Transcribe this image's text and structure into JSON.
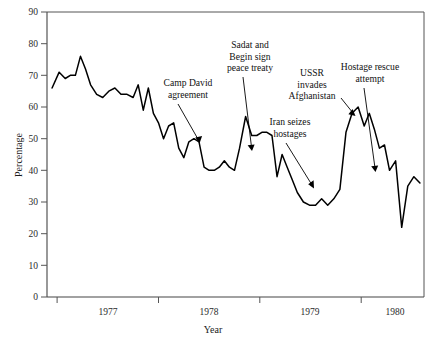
{
  "chart_data": {
    "type": "line",
    "title": "",
    "xlabel": "Year",
    "ylabel": "Percentage",
    "ylim": [
      0,
      90
    ],
    "ytick_values": [
      0,
      10,
      20,
      30,
      40,
      50,
      60,
      70,
      80,
      90
    ],
    "ytick_labels": [
      "0",
      "10",
      "20",
      "30",
      "40",
      "50",
      "60",
      "70",
      "80",
      "90"
    ],
    "xlim": [
      1976.9,
      1980.62
    ],
    "xtick_boundaries": [
      1977.0,
      1978.0,
      1979.0,
      1980.0
    ],
    "xtick_labels": [
      "1977",
      "1978",
      "1979",
      "1980"
    ],
    "xtick_label_positions": [
      1977.5,
      1978.5,
      1979.5,
      1980.3
    ],
    "grid": false,
    "legend": false,
    "series": [
      {
        "name": "Percentage",
        "x": [
          1976.95,
          1977.02,
          1977.08,
          1977.13,
          1977.18,
          1977.23,
          1977.28,
          1977.33,
          1977.39,
          1977.45,
          1977.51,
          1977.57,
          1977.63,
          1977.69,
          1977.75,
          1977.8,
          1977.85,
          1977.9,
          1977.95,
          1978.0,
          1978.05,
          1978.1,
          1978.15,
          1978.2,
          1978.25,
          1978.3,
          1978.35,
          1978.4,
          1978.45,
          1978.5,
          1978.55,
          1978.6,
          1978.65,
          1978.7,
          1978.75,
          1978.8,
          1978.86,
          1978.92,
          1978.97,
          1979.02,
          1979.07,
          1979.12,
          1979.17,
          1979.22,
          1979.27,
          1979.32,
          1979.37,
          1979.43,
          1979.49,
          1979.55,
          1979.61,
          1979.67,
          1979.73,
          1979.79,
          1979.85,
          1979.91,
          1979.97,
          1980.03,
          1980.08,
          1980.13,
          1980.18,
          1980.23,
          1980.28,
          1980.34,
          1980.4,
          1980.46,
          1980.52,
          1980.58
        ],
        "y": [
          66,
          71,
          69,
          70,
          70,
          76,
          72,
          67,
          64,
          63,
          65,
          66,
          64,
          64,
          63,
          67,
          59,
          66,
          58,
          55,
          50,
          54,
          55,
          47,
          44,
          49,
          50,
          49,
          41,
          40,
          40,
          41,
          43,
          41,
          40,
          47,
          57,
          51,
          51,
          52,
          52,
          51,
          38,
          45,
          41,
          37,
          33,
          30,
          29,
          29,
          31,
          29,
          31,
          34,
          52,
          58,
          60,
          54,
          58,
          53,
          47,
          48,
          40,
          43,
          22,
          35,
          38,
          36
        ]
      }
    ],
    "annotations": [
      {
        "id": "camp-david",
        "lines": [
          "Camp David",
          "agreement"
        ],
        "text": "Camp David agreement"
      },
      {
        "id": "sadat-begin",
        "lines": [
          "Sadat and",
          "Begin sign",
          "peace treaty"
        ],
        "text": "Sadat and Begin sign peace treaty"
      },
      {
        "id": "iran-hostages",
        "lines": [
          "Iran seizes",
          "hostages"
        ],
        "text": "Iran seizes hostages"
      },
      {
        "id": "ussr-afghanistan",
        "lines": [
          "USSR",
          "invades",
          "Afghanistan"
        ],
        "text": "USSR invades Afghanistan"
      },
      {
        "id": "hostage-rescue",
        "lines": [
          "Hostage rescue",
          "attempt"
        ],
        "text": "Hostage rescue attempt"
      }
    ],
    "colors": {
      "line": "#000000",
      "axis": "#444444",
      "frame": "#555555",
      "background": "#ffffff"
    }
  }
}
